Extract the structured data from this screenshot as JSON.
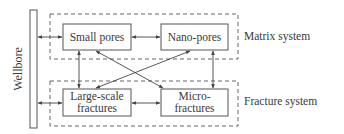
{
  "diagram": {
    "wellbore": {
      "label": "Wellbore"
    },
    "systems": [
      {
        "id": "matrix",
        "label": "Matrix system"
      },
      {
        "id": "fracture",
        "label": "Fracture system"
      }
    ],
    "nodes": {
      "small_pores": {
        "lines": [
          "Small pores"
        ]
      },
      "nano_pores": {
        "lines": [
          "Nano-pores"
        ]
      },
      "large_fractures": {
        "lines": [
          "Large-scale",
          "fractures"
        ]
      },
      "micro_fractures": {
        "lines": [
          "Micro-",
          "fractures"
        ]
      }
    },
    "edges": [
      {
        "from": "wellbore",
        "to": "small_pores",
        "type": "bidirectional"
      },
      {
        "from": "wellbore",
        "to": "large_fractures",
        "type": "bidirectional"
      },
      {
        "from": "small_pores",
        "to": "nano_pores",
        "type": "bidirectional"
      },
      {
        "from": "large_fractures",
        "to": "micro_fractures",
        "type": "bidirectional"
      },
      {
        "from": "small_pores",
        "to": "large_fractures",
        "type": "bidirectional"
      },
      {
        "from": "nano_pores",
        "to": "micro_fractures",
        "type": "bidirectional"
      },
      {
        "from": "small_pores",
        "to": "micro_fractures",
        "type": "bidirectional"
      },
      {
        "from": "nano_pores",
        "to": "large_fractures",
        "type": "bidirectional"
      }
    ],
    "colors": {
      "line": "#555555",
      "text": "#3a3a3a",
      "background": "#ffffff"
    }
  }
}
